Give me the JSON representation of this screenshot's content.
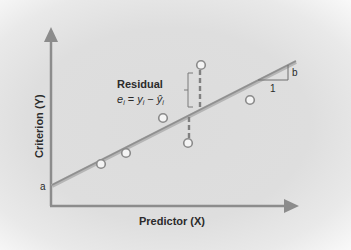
{
  "diagram": {
    "y_axis_label": "Criterion (Y)",
    "x_axis_label": "Predictor (X)",
    "intercept_label": "a",
    "slope_label": "b",
    "slope_run_label": "1",
    "residual_title": "Residual",
    "residual_formula": {
      "e": "e",
      "i": "i",
      "eq": " = ",
      "y": "y",
      "minus": " − ",
      "yhat": "ŷ"
    },
    "colors": {
      "background": "#dedede",
      "axis": "#8c8c8c",
      "regression_line": "#9a9a9a",
      "point_fill": "#f4f4f4",
      "point_stroke": "#8a8a8a",
      "text": "#2b2b2b"
    },
    "points": [
      {
        "x": 101,
        "y": 164
      },
      {
        "x": 126,
        "y": 153
      },
      {
        "x": 163,
        "y": 118
      },
      {
        "x": 188,
        "y": 143
      },
      {
        "x": 201,
        "y": 65
      },
      {
        "x": 250,
        "y": 100
      }
    ]
  }
}
